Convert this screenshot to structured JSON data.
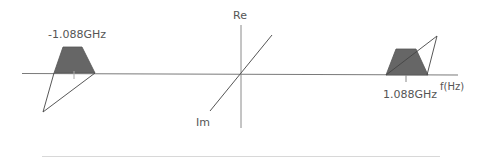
{
  "diagram": {
    "axes": {
      "vertical_label": "Re",
      "depth_label": "Im",
      "horizontal_label": "f(Hz)"
    },
    "bands": [
      {
        "id": "negative",
        "label": "-1.088GHz",
        "center_freq_ghz": -1.088
      },
      {
        "id": "positive",
        "label": "1.088GHz",
        "center_freq_ghz": 1.088
      }
    ],
    "colors": {
      "axis": "#7a7a7a",
      "band_fill": "#666666",
      "line": "#333333",
      "text": "#555555"
    }
  }
}
